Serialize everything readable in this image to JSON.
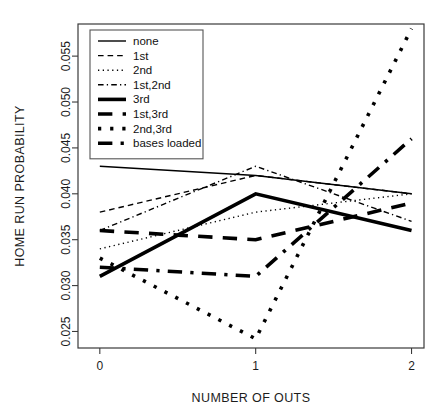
{
  "chart_data": {
    "type": "line",
    "title": "",
    "xlabel": "NUMBER OF OUTS",
    "ylabel": "HOME RUN PROBABILITY",
    "x": [
      0,
      1,
      2
    ],
    "xticklabels": [
      "0",
      "1",
      "2"
    ],
    "yticklabels": [
      "0.025",
      "0.030",
      "0.035",
      "0.040",
      "0.045",
      "0.050",
      "0.055"
    ],
    "ytickvalues": [
      0.025,
      0.03,
      0.035,
      0.04,
      0.045,
      0.05,
      0.055
    ],
    "xlim": [
      -0.14,
      2.08
    ],
    "ylim": [
      0.0232,
      0.0585
    ],
    "grid": false,
    "legend_position": "top-left-inside",
    "series": [
      {
        "name": "none",
        "values": [
          0.043,
          0.042,
          0.04
        ],
        "dash": "none",
        "width": 1.4
      },
      {
        "name": "1st",
        "values": [
          0.038,
          0.042,
          0.04
        ],
        "dash": "dashed",
        "width": 1.4
      },
      {
        "name": "2nd",
        "values": [
          0.034,
          0.038,
          0.04
        ],
        "dash": "dotted",
        "width": 1.4
      },
      {
        "name": "1st,2nd",
        "values": [
          0.036,
          0.043,
          0.037
        ],
        "dash": "dashdot",
        "width": 1.4
      },
      {
        "name": "3rd",
        "values": [
          0.031,
          0.04,
          0.036
        ],
        "dash": "none",
        "width": 3.6
      },
      {
        "name": "1st,3rd",
        "values": [
          0.036,
          0.035,
          0.039
        ],
        "dash": "dashed",
        "width": 3.6
      },
      {
        "name": "2nd,3rd",
        "values": [
          0.033,
          0.0242,
          0.058
        ],
        "dash": "dotted",
        "width": 3.6
      },
      {
        "name": "bases loaded",
        "values": [
          0.032,
          0.031,
          0.046
        ],
        "dash": "dashdot",
        "width": 3.6
      }
    ]
  },
  "axes": {
    "x_title": "NUMBER OF OUTS",
    "y_title": "HOME RUN PROBABILITY"
  },
  "legend": {
    "items": [
      {
        "label": "none"
      },
      {
        "label": "1st"
      },
      {
        "label": "2nd"
      },
      {
        "label": "1st,2nd"
      },
      {
        "label": "3rd"
      },
      {
        "label": "1st,3rd"
      },
      {
        "label": "2nd,3rd"
      },
      {
        "label": "bases loaded"
      }
    ]
  },
  "colors": {
    "ink": "#000000",
    "axis": "#3a3a3a",
    "background": "#ffffff"
  }
}
